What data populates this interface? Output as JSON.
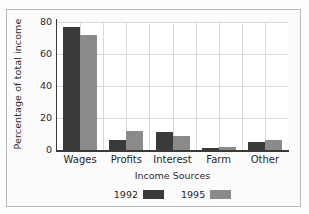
{
  "figure": {
    "top_sliver_text": "",
    "background_color": "#fdfdfd",
    "frame_border_color": "#b9b9b9"
  },
  "chart_data": {
    "type": "bar",
    "title": "",
    "subtitle": "",
    "xlabel": "Income Sources",
    "ylabel": "Percentage of total income",
    "categories": [
      "Wages",
      "Profits",
      "Interest",
      "Farm",
      "Other"
    ],
    "series": [
      {
        "name": "1992",
        "color": "#3a3a3a",
        "values": [
          77,
          6,
          11,
          1,
          5
        ]
      },
      {
        "name": "1995",
        "color": "#8a8a8a",
        "values": [
          72,
          12,
          9,
          2,
          6
        ]
      }
    ],
    "ylim": [
      0,
      80
    ],
    "yticks": [
      80,
      60,
      40,
      20,
      0
    ],
    "ytick_labels": [
      "80",
      "60",
      "40",
      "20",
      "0"
    ],
    "grid": "both",
    "legend_position": "bottom",
    "annotations": []
  }
}
